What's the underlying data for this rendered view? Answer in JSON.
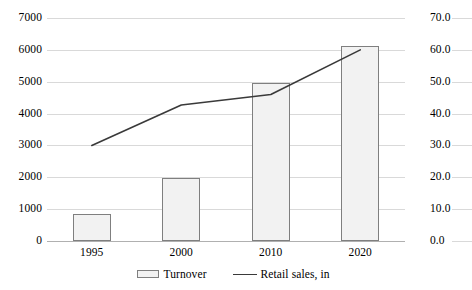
{
  "chart_data": {
    "type": "bar",
    "title": "",
    "subtitle": "",
    "xlabel": "",
    "ylabel": "",
    "y2label": "",
    "categories": [
      "1995",
      "2000",
      "2010",
      "2020"
    ],
    "grid": true,
    "legend_position": "bottom",
    "left_axis": {
      "min": 0,
      "max": 7000,
      "step": 1000,
      "ticks": [
        "0",
        "1000",
        "2000",
        "3000",
        "4000",
        "5000",
        "6000",
        "7000"
      ]
    },
    "right_axis": {
      "min": 0,
      "max": 70,
      "step": 10,
      "ticks": [
        "0.0",
        "10.0",
        "20.0",
        "30.0",
        "40.0",
        "50.0",
        "60.0",
        "70.0"
      ]
    },
    "series": [
      {
        "name": "Turnover",
        "type": "bar",
        "axis": "left",
        "values": [
          850,
          1980,
          4950,
          6110
        ],
        "fill_color": "#f2f2f2",
        "border_color": "#7f7f7f"
      },
      {
        "name": "Retail sales, in",
        "type": "line",
        "axis": "right",
        "values": [
          30.0,
          42.7,
          46.0,
          60.0
        ],
        "line_color": "#3a3a3a"
      }
    ]
  },
  "legend": {
    "items": [
      {
        "label": "Turnover",
        "marker": "bar-swatch-icon"
      },
      {
        "label": "Retail sales, in",
        "marker": "line-swatch-icon"
      }
    ]
  },
  "left_ticks": [
    {
      "label": "7000"
    },
    {
      "label": "6000"
    },
    {
      "label": "5000"
    },
    {
      "label": "4000"
    },
    {
      "label": "3000"
    },
    {
      "label": "2000"
    },
    {
      "label": "1000"
    },
    {
      "label": "0"
    }
  ],
  "right_ticks": [
    {
      "label": "70.0"
    },
    {
      "label": "60.0"
    },
    {
      "label": "50.0"
    },
    {
      "label": "40.0"
    },
    {
      "label": "30.0"
    },
    {
      "label": "20.0"
    },
    {
      "label": "10.0"
    },
    {
      "label": "0.0"
    }
  ],
  "x_ticks": [
    {
      "label": "1995"
    },
    {
      "label": "2000"
    },
    {
      "label": "2010"
    },
    {
      "label": "2020"
    }
  ]
}
